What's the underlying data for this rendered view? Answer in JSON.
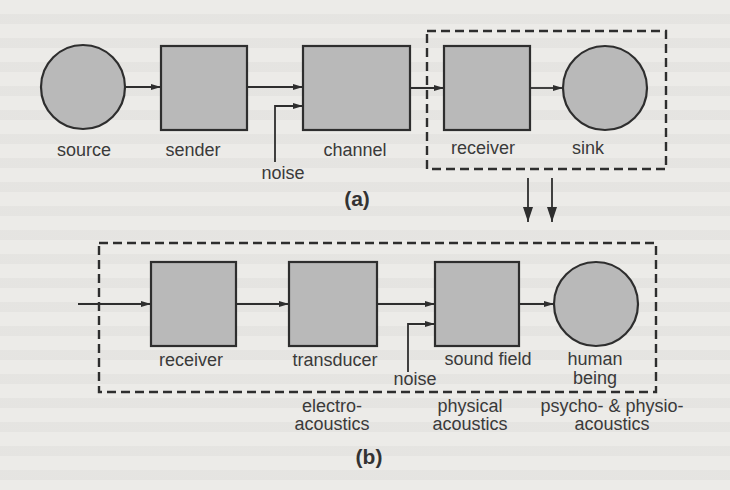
{
  "colors": {
    "background": "#ecebe8",
    "node_fill": "#b9b9b9",
    "stroke": "#2e2e2e",
    "text": "#3a3a3a"
  },
  "diagram_a": {
    "caption": "(a)",
    "nodes": [
      {
        "id": "source",
        "shape": "circle",
        "label": "source"
      },
      {
        "id": "sender",
        "shape": "box",
        "label": "sender"
      },
      {
        "id": "channel",
        "shape": "box",
        "label": "channel"
      },
      {
        "id": "receiver",
        "shape": "box",
        "label": "receiver"
      },
      {
        "id": "sink",
        "shape": "circle",
        "label": "sink"
      }
    ],
    "noise_label": "noise",
    "edges": [
      [
        "source",
        "sender"
      ],
      [
        "sender",
        "channel"
      ],
      [
        "noise",
        "channel"
      ],
      [
        "channel",
        "receiver"
      ],
      [
        "receiver",
        "sink"
      ]
    ],
    "grouped": [
      "receiver",
      "sink"
    ]
  },
  "diagram_b": {
    "caption": "(b)",
    "nodes": [
      {
        "id": "receiver",
        "shape": "box",
        "label": "receiver"
      },
      {
        "id": "transducer",
        "shape": "box",
        "label": "transducer"
      },
      {
        "id": "sound_field",
        "shape": "box",
        "label": "sound field"
      },
      {
        "id": "human_being",
        "shape": "circle",
        "label_line1": "human",
        "label_line2": "being"
      }
    ],
    "noise_label": "noise",
    "edges": [
      [
        "input",
        "receiver"
      ],
      [
        "receiver",
        "transducer"
      ],
      [
        "transducer",
        "sound_field"
      ],
      [
        "noise",
        "sound_field"
      ],
      [
        "sound_field",
        "human_being"
      ]
    ],
    "domains": [
      {
        "line1": "electro-",
        "line2": "acoustics"
      },
      {
        "line1": "physical",
        "line2": "acoustics"
      },
      {
        "line1": "psycho- & physio-",
        "line2": "acoustics"
      }
    ]
  }
}
